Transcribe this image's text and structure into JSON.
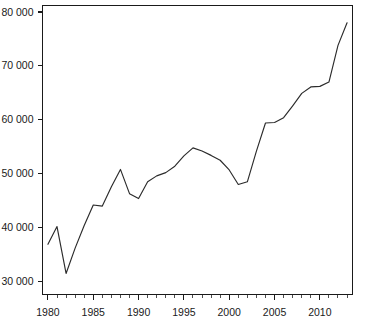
{
  "chart_data": {
    "type": "line",
    "title": "",
    "subtitle": "",
    "xlabel": "",
    "ylabel": "",
    "xlim": [
      1979.4,
      2013.6
    ],
    "ylim": [
      27600,
      81200
    ],
    "grid": false,
    "legend": null,
    "x_tick_labels": [
      "1980",
      "1985",
      "1990",
      "1995",
      "2000",
      "2005",
      "2010"
    ],
    "x_major_ticks": [
      1980,
      1985,
      1990,
      1995,
      2000,
      2005,
      2010
    ],
    "x_minor_tick_step": 1,
    "y_tick_labels": [
      "30 000",
      "40 000",
      "50 000",
      "60 000",
      "70 000",
      "80 000"
    ],
    "y_major_ticks": [
      30000,
      40000,
      50000,
      60000,
      70000,
      80000
    ],
    "series": [
      {
        "name": "series-1",
        "color": "#2b2b2b",
        "x": [
          1980,
          1981,
          1982,
          1983,
          1984,
          1985,
          1986,
          1987,
          1988,
          1989,
          1990,
          1991,
          1992,
          1993,
          1994,
          1995,
          1996,
          1997,
          1998,
          1999,
          2000,
          2001,
          2002,
          2003,
          2004,
          2005,
          2006,
          2007,
          2008,
          2009,
          2010,
          2011,
          2012,
          2013
        ],
        "values": [
          36900,
          40200,
          31500,
          36200,
          40400,
          44200,
          44000,
          47600,
          50800,
          46300,
          45400,
          48500,
          49600,
          50200,
          51400,
          53300,
          54800,
          54200,
          53400,
          52500,
          50700,
          48000,
          48500,
          54200,
          59400,
          59500,
          60400,
          62600,
          64900,
          66100,
          66200,
          67000,
          73800,
          78000
        ]
      }
    ],
    "annotations": []
  },
  "figure": {
    "background_color": "#ffffff",
    "frame_color": "#1a1a1a",
    "tick_label_color": "#1a1a1a"
  }
}
